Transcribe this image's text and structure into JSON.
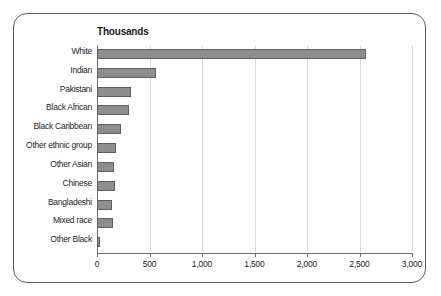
{
  "chart_data": {
    "type": "bar",
    "orientation": "horizontal",
    "title": "Thousands",
    "xlabel": "",
    "ylabel": "",
    "xlim": [
      0,
      3000
    ],
    "xticks": [
      0,
      500,
      1000,
      1500,
      2000,
      2500,
      3000
    ],
    "xtick_labels": [
      "0",
      "500",
      "1,000",
      "1,500",
      "2,000",
      "2,500",
      "3,000"
    ],
    "grid": "vertical",
    "legend": "none",
    "categories": [
      "White",
      "Indian",
      "Pakistani",
      "Black African",
      "Black Caribbean",
      "Other ethnic group",
      "Other Asian",
      "Chinese",
      "Bangladeshi",
      "Mixed race",
      "Other Black"
    ],
    "values": [
      2560,
      565,
      320,
      300,
      225,
      180,
      160,
      170,
      145,
      155,
      25
    ],
    "bar_color": "#8e8e8e",
    "bar_edge_color": "#5e5e5e",
    "gridline_color": "#d9d9d9",
    "axis_color": "#6e6e6e"
  },
  "frame": {
    "border_color": "#5a5a5a",
    "background": "#ffffff"
  }
}
